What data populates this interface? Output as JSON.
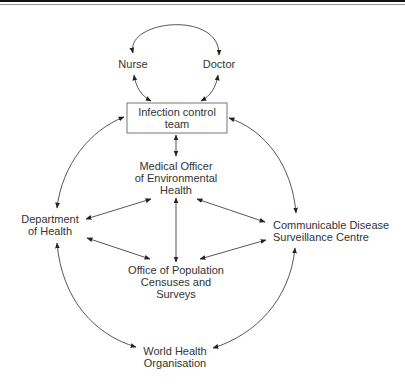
{
  "diagram": {
    "type": "communication network",
    "nodes": {
      "nurse": {
        "label": "Nurse"
      },
      "doctor": {
        "label": "Doctor"
      },
      "ict": {
        "line1": "Infection control",
        "line2": "team"
      },
      "moeh": {
        "line1": "Medical Officer",
        "line2": "of Environmental",
        "line3": "Health"
      },
      "doh": {
        "line1": "Department",
        "line2": "of Health"
      },
      "cdsc": {
        "line1": "Communicable Disease",
        "line2": "Surveillance Centre"
      },
      "opcs": {
        "line1": "Office of Population",
        "line2": "Censuses and",
        "line3": "Surveys"
      },
      "who": {
        "line1": "World Health",
        "line2": "Organisation"
      }
    },
    "edges": [
      {
        "from": "Nurse",
        "to": "Doctor",
        "direction": "both"
      },
      {
        "from": "Nurse",
        "to": "Infection control team",
        "direction": "both"
      },
      {
        "from": "Doctor",
        "to": "Infection control team",
        "direction": "both"
      },
      {
        "from": "Infection control team",
        "to": "Medical Officer of Environmental Health",
        "direction": "both"
      },
      {
        "from": "Infection control team",
        "to": "Department of Health",
        "direction": "both"
      },
      {
        "from": "Infection control team",
        "to": "Communicable Disease Surveillance Centre",
        "direction": "both"
      },
      {
        "from": "Department of Health",
        "to": "Medical Officer of Environmental Health",
        "direction": "both"
      },
      {
        "from": "Department of Health",
        "to": "Office of Population Censuses and Surveys",
        "direction": "both"
      },
      {
        "from": "Medical Officer of Environmental Health",
        "to": "Office of Population Censuses and Surveys",
        "direction": "both"
      },
      {
        "from": "Medical Officer of Environmental Health",
        "to": "Communicable Disease Surveillance Centre",
        "direction": "both"
      },
      {
        "from": "Office of Population Censuses and Surveys",
        "to": "Communicable Disease Surveillance Centre",
        "direction": "both"
      },
      {
        "from": "Department of Health",
        "to": "World Health Organisation",
        "direction": "both"
      },
      {
        "from": "Communicable Disease Surveillance Centre",
        "to": "World Health Organisation",
        "direction": "both"
      }
    ]
  },
  "colors": {
    "text": "#333333",
    "lines": "#444444",
    "top_rule": "#111111"
  }
}
